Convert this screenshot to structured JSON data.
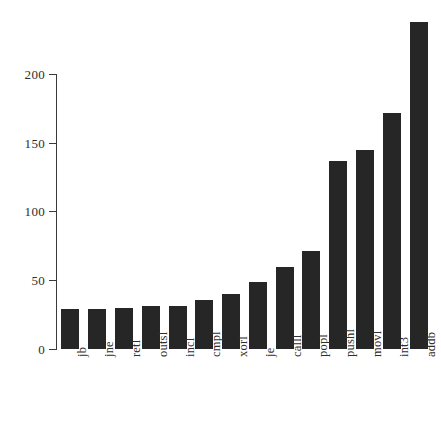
{
  "chart_data": {
    "type": "bar",
    "title": "",
    "subtitle": "",
    "xlabel": "",
    "ylabel": "",
    "categories": [
      "jb",
      "jne",
      "retl",
      "outsl",
      "incl",
      "cmpl",
      "xorl",
      "je",
      "calll",
      "popl",
      "pushl",
      "movl",
      "int3",
      "addb"
    ],
    "values": [
      29,
      29,
      30,
      31,
      31,
      36,
      40,
      49,
      60,
      71,
      137,
      145,
      172,
      238
    ],
    "ylim": [
      0,
      240
    ],
    "y_ticks": [
      0,
      50,
      100,
      150,
      200
    ],
    "y_tick_labels": [
      "0",
      "50",
      "100",
      "150",
      "200"
    ],
    "grid": false,
    "legend": false,
    "legend_position": "none",
    "bar_color": "#262626",
    "axis_color": "#3a3a3a",
    "background_color": "#ffffff",
    "x_tick_label_rotation": -90
  }
}
